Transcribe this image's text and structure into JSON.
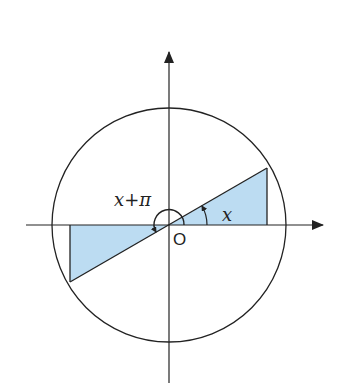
{
  "diagram": {
    "labels": {
      "angle_x": "x",
      "angle_x_plus_pi": "x+π",
      "origin": "O"
    },
    "colors": {
      "line": "#222222",
      "fill": "#bcdcf2",
      "background": "#ffffff"
    },
    "geometry": {
      "center": [
        169,
        225
      ],
      "radius": 117,
      "angle_deg": 30
    }
  }
}
